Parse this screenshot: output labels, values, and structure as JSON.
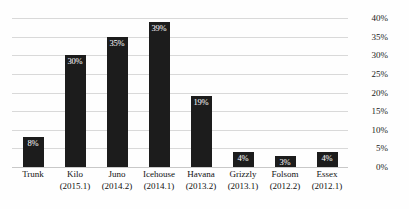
{
  "chart_data": {
    "type": "bar",
    "title": "",
    "xlabel": "",
    "ylabel": "",
    "ylim": [
      0,
      40
    ],
    "grid": true,
    "legend": false,
    "categories": [
      "Trunk",
      "Kilo",
      "Juno",
      "Icehouse",
      "Havana",
      "Grizzly",
      "Folsom",
      "Essex"
    ],
    "category_sublabels": [
      "",
      "(2015.1)",
      "(2014.2)",
      "(2014.1)",
      "(2013.2)",
      "(2013.1)",
      "(2012.2)",
      "(2012.1)"
    ],
    "values": [
      8,
      30,
      35,
      39,
      19,
      4,
      3,
      4
    ],
    "value_labels": [
      "8%",
      "30%",
      "35%",
      "39%",
      "19%",
      "4%",
      "3%",
      "4%"
    ],
    "ytick_labels": [
      "40%",
      "35%",
      "30%",
      "25%",
      "20%",
      "15%",
      "10%",
      "5%",
      "0%"
    ],
    "ytick_values": [
      40,
      35,
      30,
      25,
      20,
      15,
      10,
      5,
      0
    ],
    "bar_color": "#1c1c1c",
    "value_label_color": "#ffffff",
    "gridline_color": "#d9d9d9",
    "background_color": "#fefefe"
  }
}
